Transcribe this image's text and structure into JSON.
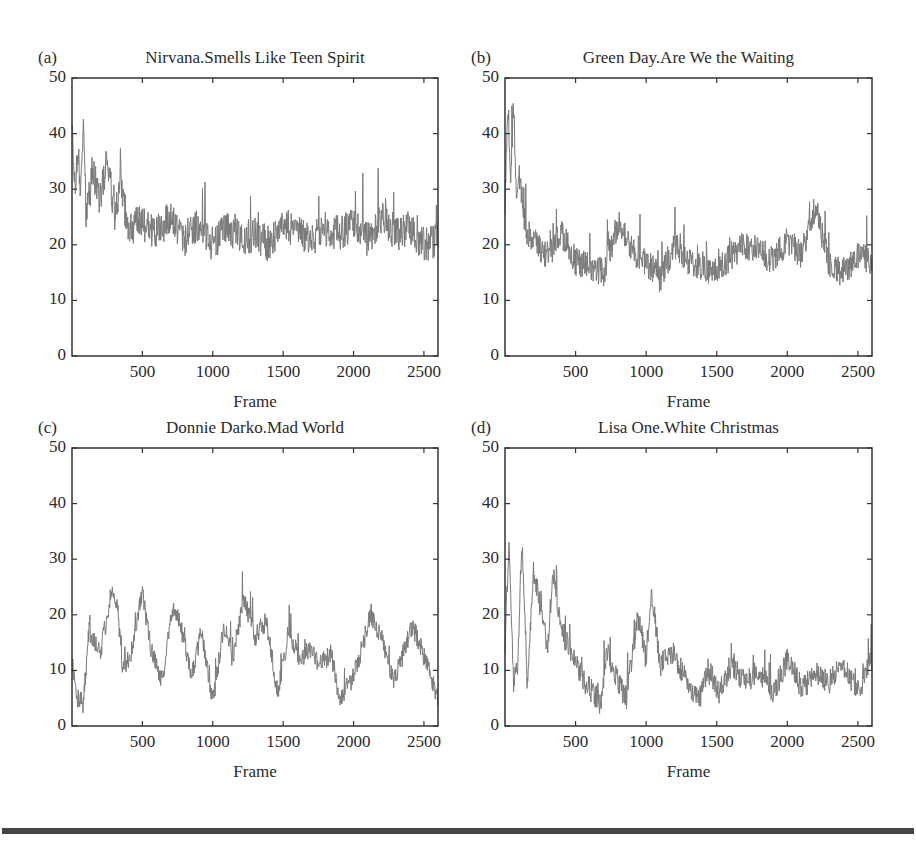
{
  "figure": {
    "panels": [
      {
        "label": "(a)",
        "title": "Nirvana.Smells Like Teen Spirit",
        "xlabel": "Frame"
      },
      {
        "label": "(b)",
        "title": "Green Day.Are We the Waiting",
        "xlabel": "Frame"
      },
      {
        "label": "(c)",
        "title": "Donnie Darko.Mad World",
        "xlabel": "Frame"
      },
      {
        "label": "(d)",
        "title": "Lisa One.White Christmas",
        "xlabel": "Frame"
      }
    ],
    "yticks": [
      "0",
      "10",
      "20",
      "30",
      "40",
      "50"
    ],
    "xticks": [
      "500",
      "1000",
      "1500",
      "2000",
      "2500"
    ],
    "line_color": "#7a7a7a",
    "axis_color": "#333333"
  },
  "chart_data": [
    {
      "type": "line",
      "title": "Nirvana.Smells Like Teen Spirit",
      "panel": "(a)",
      "xlabel": "Frame",
      "ylabel": "",
      "xlim": [
        0,
        2600
      ],
      "ylim": [
        0,
        50
      ],
      "xticks": [
        500,
        1000,
        1500,
        2000,
        2500
      ],
      "yticks": [
        0,
        10,
        20,
        30,
        40,
        50
      ],
      "grid": false,
      "x": [
        0,
        20,
        40,
        60,
        80,
        100,
        150,
        200,
        250,
        300,
        350,
        400,
        500,
        600,
        700,
        800,
        900,
        1000,
        1100,
        1200,
        1300,
        1400,
        1500,
        1600,
        1700,
        1800,
        1900,
        2000,
        2100,
        2200,
        2300,
        2400,
        2500,
        2600
      ],
      "values": [
        44,
        30,
        37,
        28,
        42,
        26,
        33,
        28,
        36,
        25,
        30,
        23,
        24,
        22,
        25,
        21,
        24,
        20,
        23,
        21,
        22,
        20,
        24,
        22,
        21,
        23,
        22,
        24,
        21,
        25,
        22,
        23,
        20,
        21
      ]
    },
    {
      "type": "line",
      "title": "Green Day.Are We the Waiting",
      "panel": "(b)",
      "xlabel": "Frame",
      "ylabel": "",
      "xlim": [
        0,
        2600
      ],
      "ylim": [
        0,
        50
      ],
      "xticks": [
        500,
        1000,
        1500,
        2000,
        2500
      ],
      "yticks": [
        0,
        10,
        20,
        30,
        40,
        50
      ],
      "grid": false,
      "x": [
        0,
        20,
        40,
        60,
        80,
        100,
        150,
        200,
        300,
        400,
        500,
        600,
        700,
        800,
        900,
        1000,
        1100,
        1200,
        1300,
        1400,
        1500,
        1600,
        1700,
        1800,
        1900,
        2000,
        2100,
        2200,
        2300,
        2400,
        2500,
        2600
      ],
      "values": [
        28,
        46,
        32,
        45,
        30,
        33,
        22,
        21,
        18,
        22,
        17,
        16,
        15,
        24,
        19,
        17,
        14,
        20,
        17,
        16,
        15,
        18,
        20,
        19,
        17,
        21,
        18,
        27,
        16,
        15,
        18,
        17
      ]
    },
    {
      "type": "line",
      "title": "Donnie Darko.Mad World",
      "panel": "(c)",
      "xlabel": "Frame",
      "ylabel": "",
      "xlim": [
        0,
        2600
      ],
      "ylim": [
        0,
        50
      ],
      "xticks": [
        500,
        1000,
        1500,
        2000,
        2500
      ],
      "yticks": [
        0,
        10,
        20,
        30,
        40,
        50
      ],
      "grid": false,
      "x": [
        0,
        40,
        80,
        120,
        200,
        280,
        320,
        360,
        420,
        500,
        560,
        640,
        720,
        780,
        850,
        920,
        1000,
        1080,
        1140,
        1220,
        1300,
        1380,
        1460,
        1540,
        1620,
        1700,
        1760,
        1840,
        1900,
        1980,
        2040,
        2120,
        2200,
        2280,
        2340,
        2420,
        2480,
        2560,
        2600
      ],
      "values": [
        12,
        5,
        4,
        17,
        13,
        24,
        22,
        10,
        13,
        24,
        14,
        8,
        22,
        17,
        9,
        17,
        4,
        18,
        12,
        23,
        16,
        19,
        6,
        17,
        12,
        14,
        11,
        13,
        5,
        8,
        12,
        20,
        16,
        8,
        12,
        18,
        14,
        8,
        5
      ]
    },
    {
      "type": "line",
      "title": "Lisa One.White Christmas",
      "panel": "(d)",
      "xlabel": "Frame",
      "ylabel": "",
      "xlim": [
        0,
        2600
      ],
      "ylim": [
        0,
        50
      ],
      "xticks": [
        500,
        1000,
        1500,
        2000,
        2500
      ],
      "yticks": [
        0,
        10,
        20,
        30,
        40,
        50
      ],
      "grid": false,
      "x": [
        0,
        30,
        60,
        90,
        120,
        160,
        200,
        260,
        300,
        340,
        380,
        420,
        500,
        560,
        620,
        680,
        720,
        780,
        860,
        940,
        1000,
        1040,
        1100,
        1200,
        1300,
        1380,
        1440,
        1520,
        1600,
        1700,
        1800,
        1900,
        2000,
        2100,
        2200,
        2300,
        2400,
        2500,
        2600
      ],
      "values": [
        15,
        33,
        8,
        10,
        34,
        6,
        28,
        20,
        14,
        27,
        21,
        16,
        12,
        8,
        6,
        4,
        14,
        9,
        5,
        20,
        12,
        24,
        11,
        13,
        7,
        5,
        10,
        6,
        11,
        8,
        10,
        6,
        12,
        7,
        9,
        8,
        11,
        6,
        12
      ]
    }
  ]
}
